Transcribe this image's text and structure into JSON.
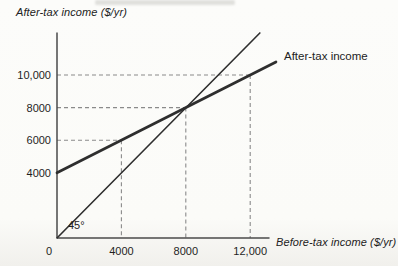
{
  "chart_data": {
    "type": "line",
    "title": "",
    "xlabel": "Before-tax income ($/yr)",
    "ylabel": "After-tax income ($/yr)",
    "xlim": [
      0,
      13200
    ],
    "ylim": [
      0,
      12600
    ],
    "grid": false,
    "legend": "none",
    "x_ticks": [
      {
        "value": 0,
        "label": "0"
      },
      {
        "value": 4000,
        "label": "4000"
      },
      {
        "value": 8000,
        "label": "8000"
      },
      {
        "value": 12000,
        "label": "12,000"
      }
    ],
    "y_ticks": [
      {
        "value": 4000,
        "label": "4000"
      },
      {
        "value": 6000,
        "label": "6000"
      },
      {
        "value": 8000,
        "label": "8000"
      },
      {
        "value": 10000,
        "label": "10,000"
      }
    ],
    "series": [
      {
        "name": "45-degree-line",
        "label": "45°",
        "slope": 1,
        "intercept": 0,
        "points": [
          [
            0,
            0
          ],
          [
            12600,
            12580
          ]
        ],
        "stroke_width": 1.6,
        "color": "#2e2e2e"
      },
      {
        "name": "after-tax-income-line",
        "label": "After-tax income",
        "slope": 0.5,
        "intercept": 4000,
        "points": [
          [
            0,
            4000
          ],
          [
            13600,
            10800
          ]
        ],
        "stroke_width": 2.7,
        "color": "#2e2e2e"
      }
    ],
    "guide_points": [
      [
        4000,
        6000
      ],
      [
        8000,
        8000
      ],
      [
        12000,
        10000
      ]
    ],
    "dash_color": "#8a8a8a",
    "line_label": "After-tax income",
    "angle_label": "45°"
  }
}
